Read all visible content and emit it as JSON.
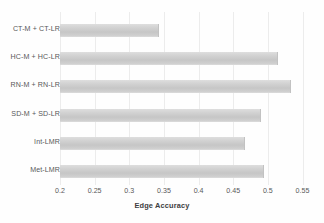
{
  "chart_data": {
    "type": "bar",
    "orientation": "horizontal",
    "title": "",
    "xlabel": "Edge Accuracy",
    "ylabel": "",
    "xlim": [
      0.2,
      0.55
    ],
    "xticks": [
      "0.2",
      "0.25",
      "0.3",
      "0.35",
      "0.4",
      "0.45",
      "0.5",
      "0.55"
    ],
    "xtick_values": [
      0.2,
      0.25,
      0.3,
      0.35,
      0.4,
      0.45,
      0.5,
      0.55
    ],
    "grid": "vertical",
    "legend": "none",
    "categories": [
      "CT-M + CT-LR",
      "HC-M + HC-LR",
      "RN-M + RN-LR",
      "SD-M + SD-LR",
      "Int-LMR",
      "Met-LMR"
    ],
    "values": [
      0.342,
      0.513,
      0.532,
      0.489,
      0.466,
      0.493
    ],
    "bar_color": "#cfcfcf",
    "grid_color": "#ececec",
    "text_color": "#58585a"
  }
}
